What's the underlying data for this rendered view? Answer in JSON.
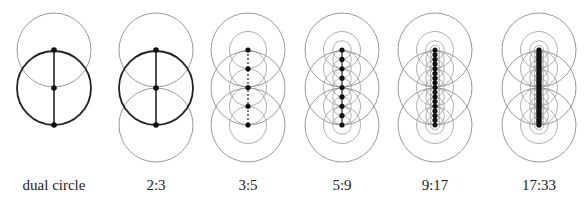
{
  "figure": {
    "panels": [
      {
        "label": "dual circle",
        "cx": 54,
        "ratio": "dual",
        "levels": 0
      },
      {
        "label": "2:3",
        "cx": 156,
        "ratio": "2:3",
        "levels": 0
      },
      {
        "label": "3:5",
        "cx": 248,
        "ratio": "3:5",
        "levels": 1
      },
      {
        "label": "5:9",
        "cx": 342,
        "ratio": "5:9",
        "levels": 2
      },
      {
        "label": "9:17",
        "cx": 435,
        "ratio": "9:17",
        "levels": 3
      },
      {
        "label": "17:33",
        "cx": 539,
        "ratio": "17:33",
        "levels": 4
      }
    ],
    "geometry": {
      "top_y": 50,
      "mid_y": 88,
      "bottom_y": 125,
      "radius": 37
    },
    "colors": {
      "light_circle": "#9a9a9a",
      "bold_circle": "#222222",
      "dot": "#111111",
      "line": "#222222"
    }
  }
}
